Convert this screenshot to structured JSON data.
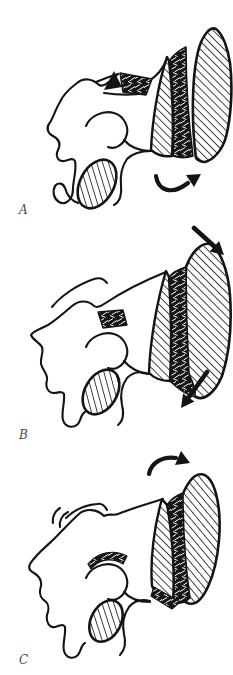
{
  "figure": {
    "colors": {
      "ink": "#141414",
      "paper": "#ffffff",
      "label_text": "#4a4a4a"
    },
    "panels": [
      {
        "label": "A",
        "icons": [
          "wedge-graft-arrow-icon",
          "curved-rotation-arrow-icon"
        ],
        "content": "scapula lateral view, opening-wedge osteotomy with small wedge removed at spine and curved arrow rotating glenoid fragment up-right"
      },
      {
        "label": "B",
        "icons": [
          "shear-arrow-down-right-icon",
          "shear-arrow-down-left-icon"
        ],
        "content": "scapula lateral view with graft block, straight arrows indicating downward shear above and below glenoid block"
      },
      {
        "label": "C",
        "icons": [
          "curved-rotation-arrow-icon"
        ],
        "content": "scapula lateral view with tilted glenoid bone block and clockwise curved arrow above"
      }
    ]
  }
}
